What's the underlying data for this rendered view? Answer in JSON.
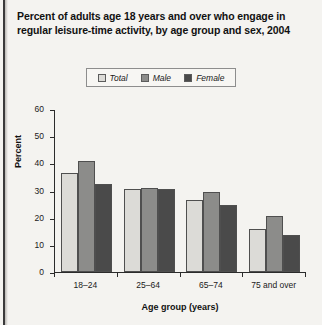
{
  "title": "Percent of adults age 18 years and over who engage in regular leisure-time activity, by age group and sex, 2004",
  "chart_data": {
    "type": "bar",
    "title": "Percent of adults age 18 years and over who engage in regular leisure-time activity, by age group and sex, 2004",
    "categories": [
      "18–24",
      "25–64",
      "65–74",
      "75 and over"
    ],
    "series": [
      {
        "name": "Total",
        "values": [
          36.5,
          30.5,
          26.5,
          16.0
        ],
        "color": "#dcdbd7"
      },
      {
        "name": "Male",
        "values": [
          41.0,
          31.0,
          29.5,
          20.5
        ],
        "color": "#8c8c8a"
      },
      {
        "name": "Female",
        "values": [
          32.5,
          30.5,
          24.5,
          13.5
        ],
        "color": "#4a4a4a"
      }
    ],
    "xlabel": "Age group (years)",
    "ylabel": "Percent",
    "ylim": [
      0,
      60
    ],
    "yticks": [
      0,
      10,
      20,
      30,
      40,
      50,
      60
    ],
    "ytick_labels": [
      "0",
      "10",
      "20",
      "30",
      "40",
      "50",
      "60"
    ],
    "grid": false,
    "legend_position": "top-center"
  },
  "legend": {
    "items": [
      {
        "label": "Total",
        "color": "#dcdbd7"
      },
      {
        "label": "Male",
        "color": "#8c8c8a"
      },
      {
        "label": "Female",
        "color": "#4a4a4a"
      }
    ]
  }
}
